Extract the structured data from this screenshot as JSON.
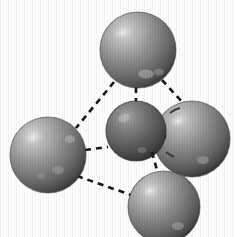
{
  "figure": {
    "background_color": "#ffffff",
    "width": 235,
    "height": 237,
    "bond_style": "dashed",
    "bond_color": "#161616",
    "render_style": "shaded-spheres-halftone-scan"
  },
  "chart_data": {
    "type": "scatter",
    "xlabel": "",
    "ylabel": "",
    "xlim": [
      0,
      235
    ],
    "ylim": [
      0,
      237
    ],
    "grid": false,
    "legend": "none",
    "nodes": [
      {
        "id": "atom-top",
        "label": "",
        "cx": 138,
        "cy": 50,
        "r": 38,
        "fill": "#8e8e8e",
        "highlight": "#d2d2d2",
        "shade": "#4a4a4a",
        "size_class": "large",
        "z": 2
      },
      {
        "id": "atom-left",
        "label": "",
        "cx": 48,
        "cy": 155,
        "r": 38,
        "fill": "#8e8e8e",
        "highlight": "#d4d4d4",
        "shade": "#4a4a4a",
        "size_class": "large",
        "z": 2
      },
      {
        "id": "atom-center",
        "label": "",
        "cx": 136,
        "cy": 131,
        "r": 30,
        "fill": "#6d6d6d",
        "highlight": "#a8a8a8",
        "shade": "#343434",
        "size_class": "small",
        "z": 3
      },
      {
        "id": "atom-right",
        "label": "",
        "cx": 192,
        "cy": 139,
        "r": 38,
        "fill": "#8b8b8b",
        "highlight": "#cfcfcf",
        "shade": "#474747",
        "size_class": "large",
        "z": 1
      },
      {
        "id": "atom-bottom",
        "label": "",
        "cx": 164,
        "cy": 207,
        "r": 36,
        "fill": "#8c8c8c",
        "highlight": "#d0d0d0",
        "shade": "#474747",
        "size_class": "large",
        "z": 4
      }
    ],
    "bonds": [
      {
        "id": "bond-top-left",
        "from": "atom-top",
        "to": "atom-left",
        "x1": 114,
        "y1": 82,
        "x2": 76,
        "y2": 128
      },
      {
        "id": "bond-top-center",
        "from": "atom-top",
        "to": "atom-center",
        "x1": 136,
        "y1": 87,
        "x2": 136,
        "y2": 101
      },
      {
        "id": "bond-top-right",
        "from": "atom-top",
        "to": "atom-right",
        "x1": 162,
        "y1": 80,
        "x2": 183,
        "y2": 103
      },
      {
        "id": "bond-left-center",
        "from": "atom-left",
        "to": "atom-center",
        "x1": 85,
        "y1": 150,
        "x2": 108,
        "y2": 147
      },
      {
        "id": "bond-left-bottom",
        "from": "atom-left",
        "to": "atom-bottom",
        "x1": 77,
        "y1": 176,
        "x2": 134,
        "y2": 196
      },
      {
        "id": "bond-center-bottom",
        "from": "atom-center",
        "to": "atom-bottom",
        "x1": 152,
        "y1": 152,
        "x2": 158,
        "y2": 174
      },
      {
        "id": "bond-center-right",
        "from": "atom-center",
        "to": "atom-right",
        "x1": 160,
        "y1": 124,
        "x2": 168,
        "y2": 128
      }
    ],
    "values": [
      50,
      155,
      131,
      139,
      207
    ],
    "categories": [
      "atom-top",
      "atom-left",
      "atom-center",
      "atom-right",
      "atom-bottom"
    ]
  }
}
